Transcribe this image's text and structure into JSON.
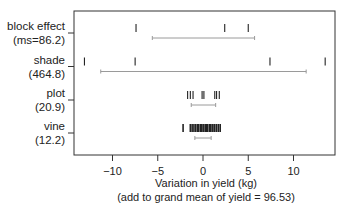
{
  "chart_data": {
    "type": "strip",
    "title": "",
    "xlabel": "Variation in yield (kg)",
    "xlabel_sub": "(add to grand mean of yield = 96.53)",
    "ylabel": "",
    "xlim": [
      -14.2,
      14.6
    ],
    "xticks": [
      -10,
      -5,
      0,
      5,
      10
    ],
    "xtick_labels": [
      "−10",
      "−5",
      "0",
      "5",
      "10"
    ],
    "grid": false,
    "legend": null,
    "series": [
      {
        "name": "block effect",
        "label_line1": "block effect",
        "label_line2": "(ms=86.2)",
        "mean_square": 86.2,
        "effects": [
          -7.4,
          2.4,
          5.0
        ],
        "interval": [
          -5.6,
          5.7
        ]
      },
      {
        "name": "shade",
        "label_line1": "shade",
        "label_line2": "(464.8)",
        "mean_square": 464.8,
        "effects": [
          -13.1,
          -7.5,
          7.4,
          13.5
        ],
        "interval": [
          -11.3,
          11.4
        ]
      },
      {
        "name": "plot",
        "label_line1": "plot",
        "label_line2": "(20.9)",
        "mean_square": 20.9,
        "effects": [
          -1.7,
          -1.4,
          -1.1,
          -0.1,
          0.1,
          1.3,
          1.5,
          1.8
        ],
        "interval": [
          -1.3,
          1.4
        ]
      },
      {
        "name": "vine",
        "label_line1": "vine",
        "label_line2": "(12.2)",
        "mean_square": 12.2,
        "effects": [
          -2.2,
          -1.4,
          -1.2,
          -1.0,
          -0.8,
          -0.6,
          -0.5,
          -0.3,
          -0.2,
          0.0,
          0.1,
          0.3,
          0.4,
          0.5,
          0.7,
          0.8,
          1.0,
          1.1,
          1.3,
          1.5,
          1.7,
          1.9
        ],
        "interval": [
          -0.9,
          0.9
        ]
      }
    ]
  },
  "colors": {
    "axis": "#333333",
    "tick_mark": "#222222",
    "interval": "#9a9a9a",
    "text": "#222222"
  }
}
